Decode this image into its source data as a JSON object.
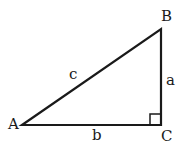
{
  "diagram": {
    "type": "right-triangle",
    "vertices": {
      "A": {
        "label": "A",
        "x": 22,
        "y": 125
      },
      "B": {
        "label": "B",
        "x": 161,
        "y": 29
      },
      "C": {
        "label": "C",
        "x": 161,
        "y": 125
      }
    },
    "sides": {
      "a": {
        "label": "a",
        "from": "B",
        "to": "C"
      },
      "b": {
        "label": "b",
        "from": "A",
        "to": "C"
      },
      "c": {
        "label": "c",
        "from": "A",
        "to": "B"
      }
    },
    "right_angle_at": "C",
    "stroke_color": "#1a1a1a"
  }
}
